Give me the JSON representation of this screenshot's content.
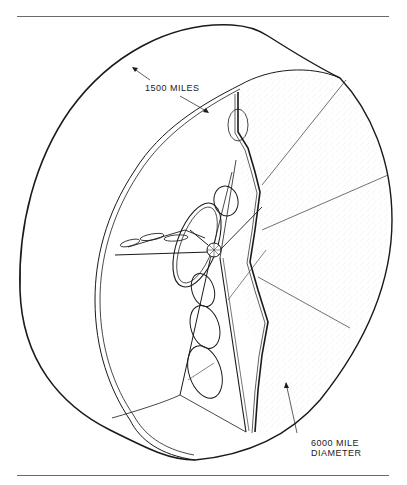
{
  "figure": {
    "annotations": {
      "width_label": "1500 MILES",
      "diameter_label_line1": "6000 MILE",
      "diameter_label_line2": "DIAMETER"
    }
  },
  "colors": {
    "line": "#1a1a1a",
    "rule": "#6a6a6a",
    "stipple": "#9a9a9a",
    "background": "#ffffff"
  }
}
